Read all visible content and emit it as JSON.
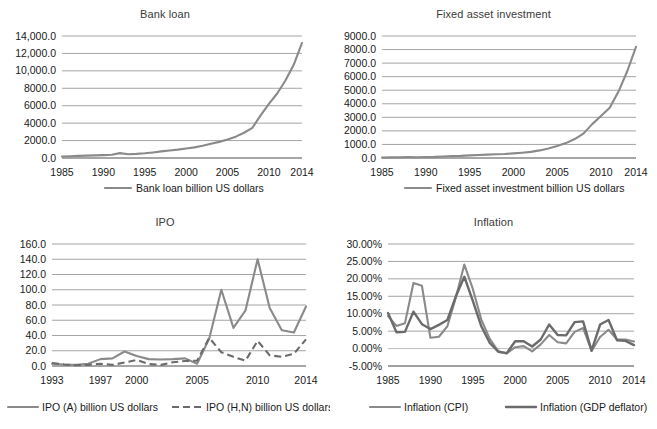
{
  "figure": {
    "panels": [
      "bank_loan",
      "fixed_asset",
      "ipo",
      "inflation"
    ]
  },
  "chart_data": [
    {
      "id": "bank_loan",
      "type": "line",
      "title": "Bank loan",
      "xlabel": "",
      "ylabel": "",
      "grid": true,
      "legend_position": "bottom",
      "xticks": [
        "1985",
        "1990",
        "1995",
        "2000",
        "2005",
        "2010",
        "2014"
      ],
      "yticks": [
        "0.0",
        "2000.0",
        "4000.0",
        "6000.0",
        "8000.0",
        "10,000.0",
        "12,000.0",
        "14,000.0"
      ],
      "xlim": [
        1985,
        2014
      ],
      "ylim": [
        0,
        14000
      ],
      "series": [
        {
          "name": "Bank loan billion US dollars",
          "style": "solid",
          "color": "#8a8a8a",
          "x": [
            1985,
            1986,
            1987,
            1988,
            1989,
            1990,
            1991,
            1992,
            1993,
            1994,
            1995,
            1996,
            1997,
            1998,
            1999,
            2000,
            2001,
            2002,
            2003,
            2004,
            2005,
            2006,
            2007,
            2008,
            2009,
            2010,
            2011,
            2012,
            2013,
            2014
          ],
          "values": [
            170,
            200,
            240,
            270,
            300,
            330,
            380,
            560,
            430,
            470,
            540,
            640,
            760,
            860,
            960,
            1090,
            1220,
            1400,
            1640,
            1850,
            2130,
            2450,
            2900,
            3450,
            4900,
            6200,
            7400,
            8900,
            10700,
            13200
          ]
        }
      ]
    },
    {
      "id": "fixed_asset",
      "type": "line",
      "title": "Fixed asset investment",
      "xlabel": "",
      "ylabel": "",
      "grid": true,
      "legend_position": "bottom",
      "xticks": [
        "1985",
        "1990",
        "1995",
        "2000",
        "2005",
        "2010",
        "2014"
      ],
      "yticks": [
        "0.0",
        "1000.0",
        "2000.0",
        "3000.0",
        "4000.0",
        "5000.0",
        "6000.0",
        "7000.0",
        "8000.0",
        "9000.0"
      ],
      "xlim": [
        1985,
        2014
      ],
      "ylim": [
        0,
        9000
      ],
      "series": [
        {
          "name": "Fixed asset investment billion US dollars",
          "style": "solid",
          "color": "#8a8a8a",
          "x": [
            1985,
            1986,
            1987,
            1988,
            1989,
            1990,
            1991,
            1992,
            1993,
            1994,
            1995,
            1996,
            1997,
            1998,
            1999,
            2000,
            2001,
            2002,
            2003,
            2004,
            2005,
            2006,
            2007,
            2008,
            2009,
            2010,
            2011,
            2012,
            2013,
            2014
          ],
          "values": [
            40,
            45,
            55,
            65,
            60,
            65,
            80,
            110,
            150,
            160,
            190,
            220,
            250,
            280,
            300,
            340,
            390,
            450,
            560,
            700,
            880,
            1100,
            1400,
            1800,
            2500,
            3100,
            3700,
            4900,
            6400,
            8200
          ]
        }
      ]
    },
    {
      "id": "ipo",
      "type": "line",
      "title": "IPO",
      "xlabel": "",
      "ylabel": "",
      "grid": true,
      "legend_position": "bottom",
      "xticks": [
        "1993",
        "1997",
        "2000",
        "2005",
        "2010",
        "2014"
      ],
      "yticks": [
        "0.0",
        "20.0",
        "40.0",
        "60.0",
        "80.0",
        "100.0",
        "120.0",
        "140.0",
        "160.0"
      ],
      "xlim": [
        1993,
        2014
      ],
      "ylim": [
        0,
        160
      ],
      "series": [
        {
          "name": "IPO (A) billion US dollars",
          "style": "solid",
          "color": "#8a8a8a",
          "x": [
            1993,
            1994,
            1995,
            1996,
            1997,
            1998,
            1999,
            2000,
            2001,
            2002,
            2003,
            2004,
            2005,
            2006,
            2007,
            2008,
            2009,
            2010,
            2011,
            2012,
            2013,
            2014
          ],
          "values": [
            3,
            2,
            1.5,
            3,
            9,
            10,
            19,
            13,
            9,
            8.5,
            9,
            10,
            3,
            36,
            100,
            50,
            73,
            140,
            76,
            47,
            44,
            78
          ]
        },
        {
          "name": "IPO (H,N) billion US dollars",
          "style": "dashed",
          "color": "#6b6b6b",
          "x": [
            1993,
            1994,
            1995,
            1996,
            1997,
            1998,
            1999,
            2000,
            2001,
            2002,
            2003,
            2004,
            2005,
            2006,
            2007,
            2008,
            2009,
            2010,
            2011,
            2012,
            2013,
            2014
          ],
          "values": [
            4,
            2,
            1,
            1.5,
            3,
            1.5,
            4.5,
            8,
            2.5,
            1.5,
            5,
            6.5,
            7,
            37,
            18,
            12,
            7,
            33,
            14,
            12,
            16,
            35
          ]
        }
      ]
    },
    {
      "id": "inflation",
      "type": "line",
      "title": "Inflation",
      "xlabel": "",
      "ylabel": "",
      "grid": true,
      "legend_position": "bottom",
      "xticks": [
        "1985",
        "1990",
        "1995",
        "2000",
        "2005",
        "2010",
        "2014"
      ],
      "yticks": [
        "-5.00%",
        "0.00%",
        "5.00%",
        "10.00%",
        "15.00%",
        "20.00%",
        "25.00%",
        "30.00%"
      ],
      "xlim": [
        1985,
        2014
      ],
      "ylim": [
        -5,
        30
      ],
      "series": [
        {
          "name": "Inflation (CPI)",
          "style": "solid",
          "color": "#9a9a9a",
          "x": [
            1985,
            1986,
            1987,
            1988,
            1989,
            1990,
            1991,
            1992,
            1993,
            1994,
            1995,
            1996,
            1997,
            1998,
            1999,
            2000,
            2001,
            2002,
            2003,
            2004,
            2005,
            2006,
            2007,
            2008,
            2009,
            2010,
            2011,
            2012,
            2013,
            2014
          ],
          "values": [
            9.3,
            6.5,
            7.3,
            18.8,
            18.0,
            3.1,
            3.4,
            6.4,
            14.7,
            24.1,
            17.1,
            8.3,
            2.8,
            -0.8,
            -1.4,
            0.4,
            0.7,
            -0.8,
            1.2,
            3.9,
            1.8,
            1.5,
            4.8,
            5.9,
            -0.7,
            3.3,
            5.4,
            2.6,
            2.6,
            2.0
          ]
        },
        {
          "name": "Inflation (GDP deflator)",
          "style": "solid-thick",
          "color": "#6b6b6b",
          "x": [
            1985,
            1986,
            1987,
            1988,
            1989,
            1990,
            1991,
            1992,
            1993,
            1994,
            1995,
            1996,
            1997,
            1998,
            1999,
            2000,
            2001,
            2002,
            2003,
            2004,
            2005,
            2006,
            2007,
            2008,
            2009,
            2010,
            2011,
            2012,
            2013,
            2014
          ],
          "values": [
            10.2,
            4.7,
            4.8,
            10.6,
            7.0,
            5.6,
            6.8,
            8.2,
            15.0,
            20.6,
            13.7,
            6.4,
            1.6,
            -0.9,
            -1.3,
            2.1,
            2.1,
            0.6,
            2.6,
            6.9,
            3.9,
            3.8,
            7.6,
            7.8,
            -0.6,
            6.9,
            8.2,
            2.4,
            2.2,
            1.0
          ]
        }
      ]
    }
  ]
}
